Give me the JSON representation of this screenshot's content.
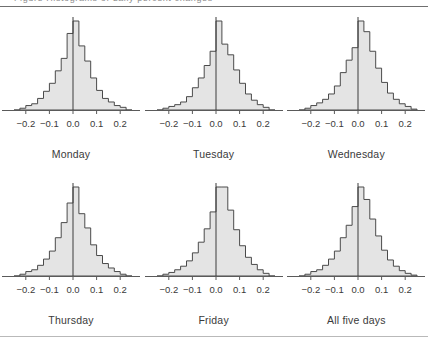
{
  "page": {
    "top_clipped_text": "Figure    Histograms of daily percent changes",
    "has_top_rule": true,
    "has_bottom_rule": true
  },
  "chart_data": {
    "type": "bar",
    "title": "",
    "subtitle": "",
    "xlabel": "",
    "ylabel": "",
    "layout": {
      "rows": 2,
      "cols": 3,
      "grid": false,
      "legend": "none"
    },
    "xlim": [
      -0.25,
      0.25
    ],
    "ylim": [
      0,
      1.0
    ],
    "xticks": [
      -0.2,
      -0.1,
      0.0,
      0.1,
      0.2
    ],
    "xticklabels": [
      "-0.2",
      "-0.1",
      "0.0",
      "0.1",
      "0.2"
    ],
    "bin_width": 0.025,
    "bin_left_edges": [
      -0.25,
      -0.225,
      -0.2,
      -0.175,
      -0.15,
      -0.125,
      -0.1,
      -0.075,
      -0.05,
      -0.025,
      0.0,
      0.025,
      0.05,
      0.075,
      0.1,
      0.125,
      0.15,
      0.175,
      0.2,
      0.225
    ],
    "zero_line": 0.0,
    "colors": {
      "fill": "#e4e4e4",
      "outline": "#4a4a4a",
      "axis": "#5a5a5a",
      "text": "#3a3a3a"
    },
    "panels": [
      {
        "label": "Monday",
        "values": [
          0.0,
          0.02,
          0.05,
          0.07,
          0.13,
          0.21,
          0.3,
          0.44,
          0.58,
          0.86,
          1.0,
          0.72,
          0.55,
          0.36,
          0.22,
          0.13,
          0.09,
          0.05,
          0.03,
          0.0
        ]
      },
      {
        "label": "Tuesday",
        "values": [
          0.0,
          0.02,
          0.04,
          0.06,
          0.09,
          0.15,
          0.25,
          0.36,
          0.5,
          0.66,
          1.0,
          0.74,
          0.62,
          0.45,
          0.3,
          0.18,
          0.11,
          0.06,
          0.03,
          0.0
        ]
      },
      {
        "label": "Wednesday",
        "values": [
          0.0,
          0.02,
          0.05,
          0.08,
          0.12,
          0.18,
          0.27,
          0.42,
          0.56,
          0.7,
          1.0,
          0.88,
          0.66,
          0.47,
          0.31,
          0.19,
          0.12,
          0.07,
          0.04,
          0.01
        ]
      },
      {
        "label": "Thursday",
        "values": [
          0.0,
          0.02,
          0.05,
          0.07,
          0.12,
          0.19,
          0.28,
          0.43,
          0.6,
          0.82,
          1.0,
          0.7,
          0.54,
          0.35,
          0.23,
          0.14,
          0.09,
          0.05,
          0.02,
          0.0
        ]
      },
      {
        "label": "Friday",
        "values": [
          0.0,
          0.02,
          0.04,
          0.07,
          0.11,
          0.17,
          0.26,
          0.38,
          0.53,
          0.72,
          1.0,
          1.0,
          0.74,
          0.52,
          0.34,
          0.21,
          0.13,
          0.07,
          0.03,
          0.0
        ]
      },
      {
        "label": "All five days",
        "values": [
          0.0,
          0.02,
          0.05,
          0.07,
          0.12,
          0.19,
          0.28,
          0.43,
          0.57,
          0.78,
          1.0,
          0.86,
          0.64,
          0.45,
          0.29,
          0.18,
          0.11,
          0.06,
          0.03,
          0.01
        ]
      }
    ]
  }
}
